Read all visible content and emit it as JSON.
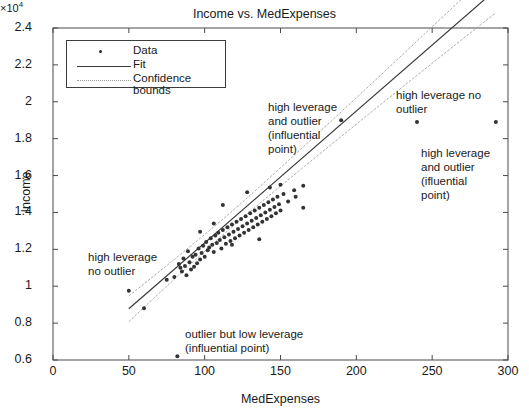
{
  "chart_data": {
    "type": "scatter",
    "title": "Income vs. MedExpenses",
    "xlabel": "MedExpenses",
    "ylabel": "Income",
    "y_exponent_label": "×10",
    "y_exponent_power": "4",
    "y_scale": 10000,
    "xlim": [
      0,
      300
    ],
    "ylim": [
      6000,
      24000
    ],
    "xticks": [
      0,
      50,
      100,
      150,
      200,
      250,
      300
    ],
    "xticklabels": [
      "0",
      "50",
      "100",
      "150",
      "200",
      "250",
      "300"
    ],
    "yticks": [
      6000,
      8000,
      10000,
      12000,
      14000,
      16000,
      18000,
      20000,
      22000,
      24000
    ],
    "yticklabels": [
      "0.6",
      "0.8",
      "1",
      "1.2",
      "1.4",
      "1.6",
      "1.8",
      "2",
      "2.2",
      "2.4"
    ],
    "grid": false,
    "legend_position": "upper left",
    "legend": [
      {
        "label": "Data",
        "marker": "dot",
        "color": "#2b2b2b"
      },
      {
        "label": "Fit",
        "marker": "solid-line",
        "color": "#3c3c3c"
      },
      {
        "label": "Confidence bounds",
        "marker": "dotted-line",
        "color": "#9a9a9a"
      }
    ],
    "fit": {
      "intercept": 5200,
      "slope": 71.5,
      "x_start": 50,
      "x_end": 292
    },
    "confidence_bounds": {
      "x_start": 50,
      "x_end": 292,
      "half_width_at_start": 700,
      "half_width_at_end": 1250,
      "half_width_at_center": 420,
      "center_x": 120
    },
    "series": [
      {
        "name": "Data",
        "points": [
          [
            50,
            9750
          ],
          [
            60,
            8800
          ],
          [
            75,
            10350
          ],
          [
            80,
            10500
          ],
          [
            82,
            6200
          ],
          [
            83,
            11200
          ],
          [
            84,
            11000
          ],
          [
            85,
            10800
          ],
          [
            86,
            11500
          ],
          [
            87,
            11100
          ],
          [
            88,
            10600
          ],
          [
            89,
            11900
          ],
          [
            90,
            11300
          ],
          [
            91,
            10900
          ],
          [
            92,
            11600
          ],
          [
            93,
            11050
          ],
          [
            94,
            11700
          ],
          [
            95,
            11250
          ],
          [
            96,
            12050
          ],
          [
            97,
            11450
          ],
          [
            98,
            11800
          ],
          [
            99,
            12200
          ],
          [
            100,
            11600
          ],
          [
            101,
            12400
          ],
          [
            102,
            11950
          ],
          [
            103,
            12100
          ],
          [
            104,
            12600
          ],
          [
            105,
            12250
          ],
          [
            106,
            11850
          ],
          [
            107,
            12750
          ],
          [
            108,
            12350
          ],
          [
            109,
            12900
          ],
          [
            110,
            12500
          ],
          [
            111,
            12050
          ],
          [
            112,
            13050
          ],
          [
            113,
            12650
          ],
          [
            114,
            12300
          ],
          [
            115,
            13200
          ],
          [
            116,
            12800
          ],
          [
            117,
            12450
          ],
          [
            118,
            13350
          ],
          [
            119,
            12950
          ],
          [
            120,
            12600
          ],
          [
            121,
            13500
          ],
          [
            122,
            13100
          ],
          [
            123,
            12750
          ],
          [
            124,
            13650
          ],
          [
            125,
            13250
          ],
          [
            126,
            12900
          ],
          [
            127,
            13800
          ],
          [
            128,
            13400
          ],
          [
            129,
            13050
          ],
          [
            130,
            13950
          ],
          [
            131,
            13550
          ],
          [
            132,
            13200
          ],
          [
            133,
            14100
          ],
          [
            134,
            13700
          ],
          [
            135,
            13350
          ],
          [
            136,
            14250
          ],
          [
            137,
            13850
          ],
          [
            138,
            13500
          ],
          [
            139,
            14400
          ],
          [
            140,
            14000
          ],
          [
            141,
            13650
          ],
          [
            142,
            14550
          ],
          [
            143,
            14150
          ],
          [
            144,
            13800
          ],
          [
            145,
            14700
          ],
          [
            146,
            14300
          ],
          [
            147,
            13950
          ],
          [
            148,
            14850
          ],
          [
            149,
            14450
          ],
          [
            150,
            14100
          ],
          [
            152,
            15000
          ],
          [
            155,
            14600
          ],
          [
            160,
            14850
          ],
          [
            165,
            14250
          ],
          [
            190,
            19000
          ],
          [
            240,
            18900
          ],
          [
            292,
            18900
          ],
          [
            112,
            14400
          ],
          [
            128,
            15100
          ],
          [
            143,
            15350
          ],
          [
            118,
            12250
          ],
          [
            106,
            13400
          ],
          [
            97,
            12950
          ],
          [
            136,
            12550
          ],
          [
            150,
            15500
          ],
          [
            159,
            15200
          ],
          [
            165,
            15450
          ]
        ]
      }
    ],
    "annotations": [
      {
        "id": "ann-high-leverage-no-outlier-left",
        "text": "high leverage\nno outlier",
        "x_px": 88,
        "y_px": 250
      },
      {
        "id": "ann-high-leverage-and-outlier-center",
        "text": "high leverage\nand outlier\n(influential\npoint)",
        "x_px": 268,
        "y_px": 100
      },
      {
        "id": "ann-high-leverage-no-outlier-right",
        "text": "high leverage no\noutlier",
        "x_px": 396,
        "y_px": 88
      },
      {
        "id": "ann-high-leverage-and-outlier-right",
        "text": "high leverage\nand outlier\n(ifluential\npoint)",
        "x_px": 421,
        "y_px": 146
      },
      {
        "id": "ann-outlier-low-leverage",
        "text": "outlier but low leverage\n(influential point)",
        "x_px": 185,
        "y_px": 327
      }
    ]
  }
}
